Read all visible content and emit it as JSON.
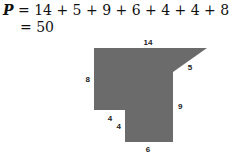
{
  "equation": {
    "variable": "P",
    "line1": "= 14 + 5 + 9 + 6 + 4 + 4 + 8",
    "line2": "= 50"
  },
  "figure": {
    "fill_color": "#6b6b6b",
    "side_labels": {
      "top": "14",
      "diagonal": "5",
      "right": "9",
      "bottom": "6",
      "inner_vertical": "4",
      "inner_horizontal": "4",
      "left": "8"
    }
  }
}
